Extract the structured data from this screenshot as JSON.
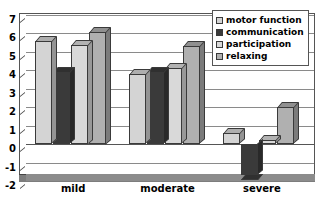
{
  "chart_data": {
    "type": "bar",
    "title": "",
    "subtitle": "",
    "xlabel": "",
    "ylabel": "",
    "ylim": [
      -2,
      7
    ],
    "yticks": [
      7,
      6,
      5,
      4,
      3,
      2,
      1,
      0,
      -1,
      -2
    ],
    "grid": true,
    "legend_position": "top-right",
    "style": "3d-grouped-column",
    "categories": [
      "mild",
      "moderate",
      "severe"
    ],
    "series": [
      {
        "name": "motor function",
        "color": "#d4d4d4",
        "values": [
          5.6,
          3.8,
          0.6
        ]
      },
      {
        "name": "communication",
        "color": "#3a3a3a",
        "values": [
          3.9,
          3.9,
          -1.7
        ]
      },
      {
        "name": "participation",
        "color": "#d9d9d9",
        "values": [
          5.4,
          4.1,
          0.2
        ]
      },
      {
        "name": "relaxing",
        "color": "#b0b0b0",
        "values": [
          6.1,
          5.3,
          2.0
        ]
      }
    ]
  },
  "legend": {
    "items": [
      {
        "label": "motor function"
      },
      {
        "label": "communication"
      },
      {
        "label": "participation"
      },
      {
        "label": "relaxing"
      }
    ]
  },
  "axis": {
    "y_tick_labels": [
      "7",
      "6",
      "5",
      "4",
      "3",
      "2",
      "1",
      "0",
      "-1",
      "-2"
    ],
    "x_tick_labels": [
      "mild",
      "moderate",
      "severe"
    ]
  },
  "colors": {
    "motor_function": "#d4d4d4",
    "communication": "#3a3a3a",
    "participation": "#d9d9d9",
    "relaxing": "#b0b0b0",
    "frame": "#555555",
    "grid": "#8a8a8a",
    "floor": "#8c8c8c",
    "background": "#ffffff"
  }
}
